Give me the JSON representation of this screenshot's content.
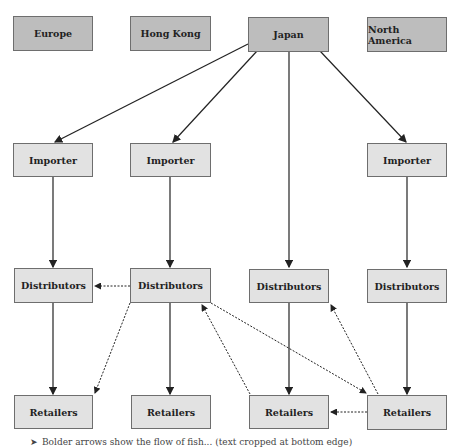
{
  "origins": [
    {
      "label": "Europe"
    },
    {
      "label": "Hong Kong"
    },
    {
      "label": "Japan"
    },
    {
      "label": "North America"
    }
  ],
  "rows": {
    "importers": [
      {
        "label": "Importer"
      },
      {
        "label": "Importer"
      },
      {
        "label": "Importer"
      }
    ],
    "distributors": [
      {
        "label": "Distributors"
      },
      {
        "label": "Distributors"
      },
      {
        "label": "Distributors"
      },
      {
        "label": "Distributors"
      }
    ],
    "retailers": [
      {
        "label": "Retailers"
      },
      {
        "label": "Retailers"
      },
      {
        "label": "Retailers"
      },
      {
        "label": "Retailers"
      }
    ]
  },
  "legend": {
    "text": "Bolder arrows show the flow of fish... (text cropped at bottom edge)"
  },
  "colors": {
    "origin_fill": "#bdbdbd",
    "node_fill": "#e2e2e2",
    "border": "#6e6e6e",
    "arrow": "#222222"
  }
}
